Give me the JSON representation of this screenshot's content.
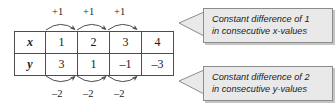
{
  "figure": {
    "background_color": "#ffffff"
  },
  "table": {
    "row_labels": [
      "x",
      "y"
    ],
    "x_values": [
      "1",
      "2",
      "3",
      "4"
    ],
    "y_values": [
      "3",
      "1",
      "–1",
      "–3"
    ],
    "border_color": "#4d4d4d"
  },
  "top_arrows": {
    "labels": [
      "+1",
      "+1",
      "+1"
    ],
    "direction": "right",
    "arc": "up"
  },
  "bottom_arrows": {
    "labels": [
      "–2",
      "–2",
      "–2"
    ],
    "direction": "right",
    "arc": "down"
  },
  "callouts": {
    "top": {
      "line1": "Constant difference of 1",
      "line2": "in consecutive x-values",
      "background_color": "#e9e9e9",
      "border_color": "#8c8c8c"
    },
    "bottom": {
      "line1": "Constant difference of 2",
      "line2": "in consecutive y-values",
      "background_color": "#e9e9e9",
      "border_color": "#8c8c8c"
    }
  }
}
